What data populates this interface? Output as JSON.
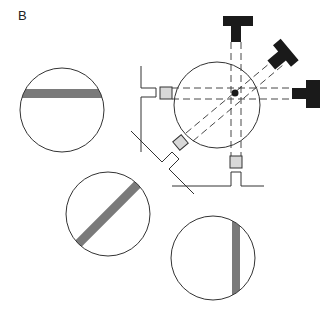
{
  "panel": {
    "label": "B"
  },
  "colors": {
    "stroke": "#333333",
    "band": "#7a7a7a",
    "detector": "#1a1a1a",
    "source_fill": "#d8d8d8",
    "background": "#ffffff"
  },
  "diagram": {
    "central_sample": {
      "cx": 217,
      "cy": 105,
      "r": 43,
      "center_dot": true
    },
    "detectors": [
      {
        "id": "top",
        "orientation": "vertical",
        "angle_deg": 90
      },
      {
        "id": "diagonal",
        "orientation": "diagonal",
        "angle_deg": 45
      },
      {
        "id": "right",
        "orientation": "horizontal",
        "angle_deg": 0
      }
    ],
    "sources": [
      {
        "id": "left",
        "angle_deg": 180
      },
      {
        "id": "lower-left",
        "angle_deg": 225
      },
      {
        "id": "bottom",
        "angle_deg": 270
      }
    ],
    "projections": [
      {
        "id": "horizontal-projection",
        "band_angle_deg": 0
      },
      {
        "id": "diagonal-projection",
        "band_angle_deg": 45
      },
      {
        "id": "vertical-projection",
        "band_angle_deg": 90
      }
    ]
  }
}
